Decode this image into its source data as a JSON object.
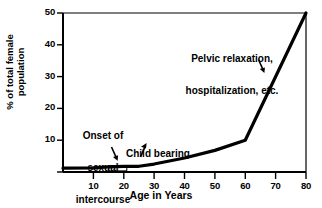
{
  "chart_data": {
    "type": "line",
    "title": "",
    "subtitle": "",
    "xlabel": "Age in Years",
    "ylabel": "% of total female population",
    "ylabel_lines": [
      "% of total female",
      "population"
    ],
    "xlim": [
      0,
      80
    ],
    "ylim": [
      0,
      50
    ],
    "xticks": [
      10,
      20,
      30,
      40,
      50,
      60,
      70,
      80
    ],
    "yticks": [
      10,
      20,
      30,
      40,
      50
    ],
    "xtick_labels": [
      "10",
      "20",
      "30",
      "40",
      "50",
      "60",
      "70",
      "80"
    ],
    "ytick_labels": [
      "10",
      "20",
      "30",
      "40",
      "50"
    ],
    "grid": false,
    "legend": false,
    "legend_position": "none",
    "line_color": "#000000",
    "axis_color": "#000000",
    "background_color": "#ffffff",
    "series": [
      {
        "name": "Percent of total female population",
        "x": [
          0,
          10,
          15,
          20,
          25,
          30,
          40,
          50,
          60,
          80
        ],
        "values": [
          1.2,
          1.3,
          1.6,
          1.8,
          1.8,
          2.5,
          4.4,
          6.8,
          10.0,
          50.0
        ]
      }
    ],
    "annotations": [
      {
        "id": "onset",
        "text": "Onset of sexual intercourse",
        "lines": [
          "Onset of",
          "sexual",
          "intercourse"
        ],
        "arrow": true,
        "points_to_x": 17,
        "points_to_y": 2.0
      },
      {
        "id": "child-bearing",
        "text": "Child bearing",
        "lines": [
          "Child bearing"
        ],
        "arrow": true,
        "points_to_x": 27,
        "points_to_y": 2.2
      },
      {
        "id": "pelvic",
        "text": "Pelvic relaxation, hospitalization, etc.",
        "lines": [
          "Pelvic relaxation,",
          "hospitalization, etc."
        ],
        "arrow": true,
        "points_to_x": 66,
        "points_to_y": 22
      }
    ],
    "markers": [
      {
        "id": "onset-bracket",
        "shape": "rectangle",
        "x_start": 15,
        "x_end": 21,
        "y": 1.8
      }
    ]
  }
}
